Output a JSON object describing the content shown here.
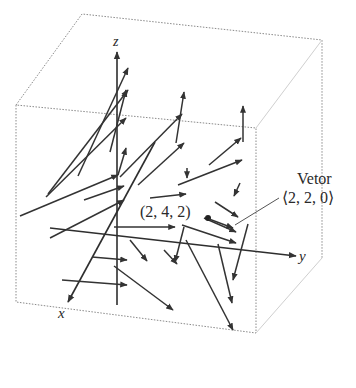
{
  "diagram": {
    "type": "3d-vector-field",
    "axes": {
      "x_label": "x",
      "y_label": "y",
      "z_label": "z"
    },
    "annotations": {
      "point_label": "(2, 4, 2)",
      "vector_title": "Vetor",
      "vector_value": "⟨2, 2, 0⟩"
    },
    "colors": {
      "arrows": "#333333",
      "box": "#8a8a8a",
      "background": "#ffffff"
    }
  }
}
